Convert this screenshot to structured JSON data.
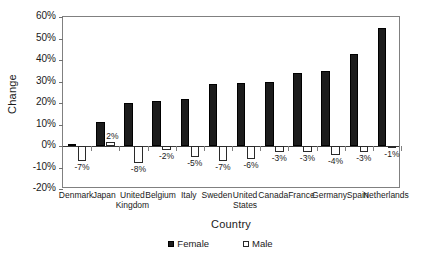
{
  "chart_data": {
    "type": "bar",
    "title": "",
    "xlabel": "Country",
    "ylabel": "Change",
    "ylim": [
      -20,
      60
    ],
    "ytick_labels": [
      "60%",
      "50%",
      "40%",
      "30%",
      "20%",
      "10%",
      "0%",
      "-10%",
      "-20%"
    ],
    "ytick_values": [
      60,
      50,
      40,
      30,
      20,
      10,
      0,
      -10,
      -20
    ],
    "grid": false,
    "legend_position": "bottom",
    "categories": [
      "Denmark",
      "Japan",
      "United Kingdom",
      "Belgium",
      "Italy",
      "Sweden",
      "United States",
      "Canada",
      "France",
      "Germany",
      "Spain",
      "Netherlands"
    ],
    "series": [
      {
        "name": "Female",
        "values": [
          1,
          11,
          20,
          21,
          22,
          29,
          29.5,
          30,
          34,
          35,
          43,
          55
        ],
        "labels": [
          "",
          "",
          "",
          "",
          "",
          "",
          "",
          "",
          "",
          "",
          "",
          ""
        ],
        "color": "#1c1c1c"
      },
      {
        "name": "Male",
        "values": [
          -7,
          2,
          -8,
          -2,
          -5,
          -7,
          -6,
          -3,
          -3,
          -4,
          -3,
          -1
        ],
        "labels": [
          "-7%",
          "2%",
          "-8%",
          "-2%",
          "-5%",
          "-7%",
          "-6%",
          "-3%",
          "-3%",
          "-4%",
          "-3%",
          "-1%"
        ],
        "color": "#ffffff"
      }
    ]
  },
  "legend": {
    "items": [
      {
        "label": "Female",
        "swatch": "filled-square-icon"
      },
      {
        "label": "Male",
        "swatch": "open-square-icon"
      }
    ]
  },
  "axes": {
    "y_title": "Change",
    "x_title": "Country"
  }
}
